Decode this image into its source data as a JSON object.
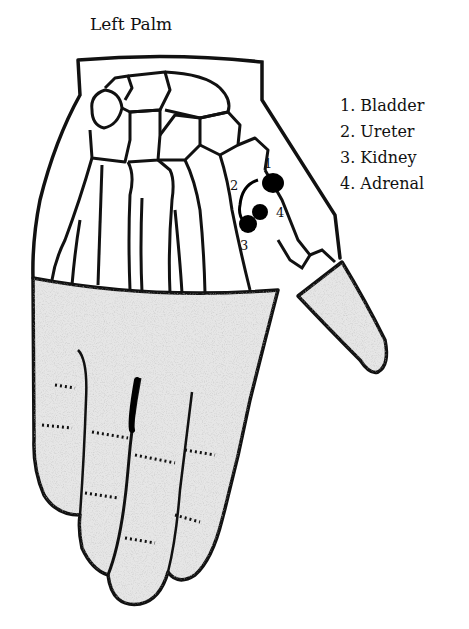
{
  "title": "Left Palm",
  "legend": {
    "items": [
      {
        "number": "1.",
        "label": "Bladder"
      },
      {
        "number": "2.",
        "label": "Ureter"
      },
      {
        "number": "3.",
        "label": "Kidney"
      },
      {
        "number": "4.",
        "label": "Adrenal"
      }
    ]
  },
  "points": {
    "p1": "1",
    "p2": "2",
    "p3": "3",
    "p4": "4"
  },
  "colors": {
    "outline": "#111111",
    "stipple": "#d9d9d9",
    "marker": "#000000"
  }
}
